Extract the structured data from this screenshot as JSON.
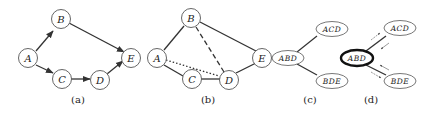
{
  "panels": [
    {
      "id": "a",
      "caption": "(a)",
      "type": "directed-graph",
      "nodes": [
        "A",
        "B",
        "C",
        "D",
        "E"
      ],
      "edges": [
        [
          "A",
          "B"
        ],
        [
          "A",
          "C"
        ],
        [
          "B",
          "E"
        ],
        [
          "C",
          "D"
        ],
        [
          "D",
          "E"
        ]
      ]
    },
    {
      "id": "b",
      "caption": "(b)",
      "type": "moralized-graph",
      "nodes": [
        "A",
        "B",
        "C",
        "D",
        "E"
      ],
      "edges_solid": [
        [
          "A",
          "B"
        ],
        [
          "A",
          "C"
        ],
        [
          "B",
          "E"
        ],
        [
          "C",
          "D"
        ],
        [
          "D",
          "E"
        ]
      ],
      "edges_dashed": [
        [
          "B",
          "D"
        ]
      ],
      "edges_dotted": [
        [
          "A",
          "D"
        ]
      ]
    },
    {
      "id": "c",
      "caption": "(c)",
      "type": "junction-tree",
      "nodes": [
        "ACD",
        "ABD",
        "BDE"
      ],
      "edges": [
        [
          "ABD",
          "ACD"
        ],
        [
          "ABD",
          "BDE"
        ]
      ]
    },
    {
      "id": "d",
      "caption": "(d)",
      "type": "message-passing",
      "root": "ABD",
      "nodes": [
        "ACD",
        "ABD",
        "BDE"
      ],
      "edges": [
        [
          "ABD",
          "ACD"
        ],
        [
          "ABD",
          "BDE"
        ]
      ]
    }
  ],
  "labels": {
    "A": "A",
    "B": "B",
    "C": "C",
    "D": "D",
    "E": "E",
    "ACD": "ACD",
    "ABD": "ABD",
    "BDE": "BDE"
  },
  "captions": {
    "a": "(a)",
    "b": "(b)",
    "c": "(c)",
    "d": "(d)"
  }
}
